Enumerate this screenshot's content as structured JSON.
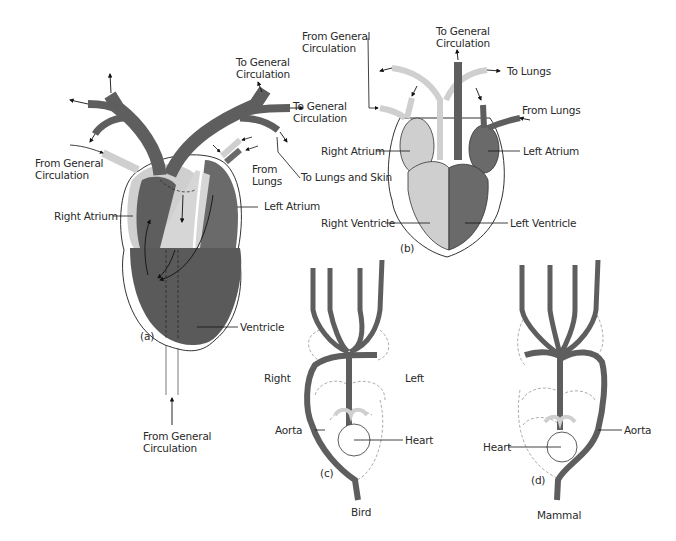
{
  "figure": {
    "colors": {
      "oxygenated": "#5e5e5e",
      "deoxygenated": "#cfcfcf",
      "outline": "#333333",
      "background": "#ffffff"
    },
    "panels": [
      {
        "id": "a",
        "tag": "(a)",
        "labels": {
          "to_gen_circ_1": "To General\nCirculation",
          "to_gen_circ_2": "To General\nCirculation",
          "from_gen_circ_top": "From General\nCirculation",
          "from_lungs": "From\nLungs",
          "to_lungs_skin": "To Lungs and Skin",
          "right_atrium": "Right Atrium",
          "left_atrium": "Left Atrium",
          "ventricle": "Ventricle",
          "from_gen_circ_bottom": "From General\nCirculation"
        }
      },
      {
        "id": "b",
        "tag": "(b)",
        "labels": {
          "from_gen_circ": "From General\nCirculation",
          "to_gen_circ": "To General\nCirculation",
          "to_lungs": "To Lungs",
          "from_lungs": "From Lungs",
          "right_atrium": "Right Atrium",
          "left_atrium": "Left Atrium",
          "right_ventricle": "Right Ventricle",
          "left_ventricle": "Left Ventricle"
        }
      },
      {
        "id": "c",
        "tag": "(c)",
        "caption": "Bird",
        "labels": {
          "right": "Right",
          "left": "Left",
          "aorta": "Aorta",
          "heart": "Heart"
        }
      },
      {
        "id": "d",
        "tag": "(d)",
        "caption": "Mammal",
        "labels": {
          "heart": "Heart",
          "aorta": "Aorta"
        }
      }
    ]
  }
}
